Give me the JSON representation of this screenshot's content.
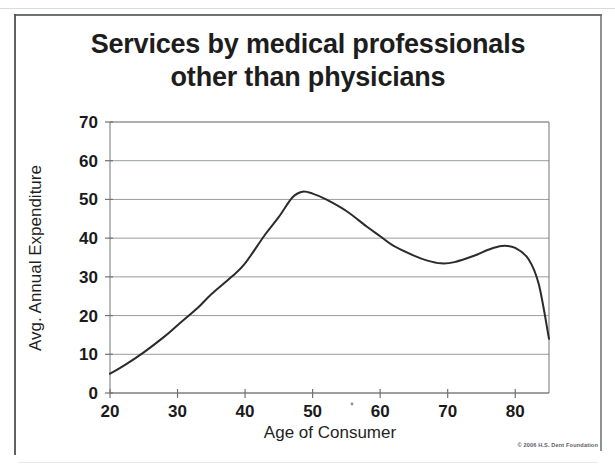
{
  "slide": {
    "title_line_1": "Services by medical professionals",
    "title_line_2": "other than physicians",
    "copyright": "© 2006 H.S. Dent Foundation",
    "background_color": "#ffffff",
    "ink_color": "#1d1d1d",
    "frame_color": "#555a5e"
  },
  "chart_data": {
    "type": "line",
    "title": "Services by medical professionals other than physicians",
    "subtitle": "",
    "xlabel": "Age of Consumer",
    "ylabel": "Avg. Annual Expenditure",
    "xlim": [
      20,
      85
    ],
    "ylim": [
      0,
      70
    ],
    "xticks": [
      20,
      30,
      40,
      50,
      60,
      70,
      80
    ],
    "xtick_labels": [
      "20",
      "30",
      "40",
      "50",
      "60",
      "70",
      "80"
    ],
    "yticks": [
      0,
      10,
      20,
      30,
      40,
      50,
      60,
      70
    ],
    "ytick_labels": [
      "0",
      "10",
      "20",
      "30",
      "40",
      "50",
      "60",
      "70"
    ],
    "grid": "horizontal",
    "legend": "none",
    "line_color": "#2b2b2b",
    "line_width": 2,
    "series": [
      {
        "name": "Avg. Annual Expenditure",
        "x": [
          20,
          22,
          25,
          28,
          30,
          33,
          35,
          38,
          40,
          43,
          45,
          47,
          48.5,
          50,
          52,
          55,
          58,
          60,
          62,
          65,
          67,
          69,
          71,
          74,
          76,
          78,
          80,
          82,
          83.5,
          85
        ],
        "values": [
          5,
          7,
          10.5,
          14.5,
          17.5,
          22,
          25.5,
          30,
          33.5,
          41,
          45.5,
          50.5,
          52,
          51.5,
          50,
          47,
          43,
          40.5,
          38,
          35.5,
          34.2,
          33.5,
          33.8,
          35.5,
          37,
          38,
          37.5,
          34.5,
          28,
          14
        ]
      }
    ],
    "annotations": [
      {
        "label": "peak",
        "x": 48.5,
        "y": 52
      },
      {
        "label": "trough",
        "x": 69,
        "y": 33.5
      },
      {
        "label": "secondary peak",
        "x": 78,
        "y": 38
      }
    ]
  },
  "plot_geometry": {
    "left_px": 110,
    "right_px": 549,
    "top_px": 122,
    "bottom_px": 393
  }
}
